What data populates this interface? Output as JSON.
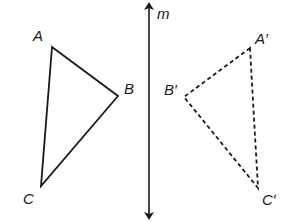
{
  "diagram": {
    "line": {
      "label": "m"
    },
    "original": {
      "points": [
        {
          "label": "A",
          "x": 52,
          "y": 47
        },
        {
          "label": "B",
          "x": 118,
          "y": 96
        },
        {
          "label": "C",
          "x": 41,
          "y": 186
        }
      ],
      "style": "solid"
    },
    "image": {
      "points": [
        {
          "label": "A′",
          "x": 250,
          "y": 48
        },
        {
          "label": "B′",
          "x": 184,
          "y": 97
        },
        {
          "label": "C′",
          "x": 258,
          "y": 188
        }
      ],
      "style": "dashed"
    },
    "colors": {
      "stroke": "#1a1a1a",
      "background": "#ffffff"
    }
  }
}
